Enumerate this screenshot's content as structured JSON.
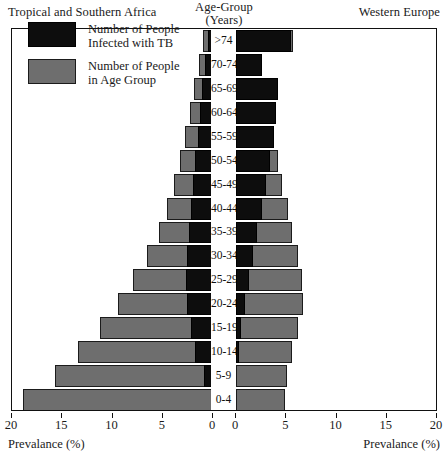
{
  "header": {
    "left_title": "Tropical and Southern Africa",
    "right_title": "Western Europe",
    "center_title_line1": "Age-Group",
    "center_title_line2": "(Years)"
  },
  "legend": {
    "items": [
      {
        "swatch": "black",
        "line1": "Number of People",
        "line2": "Infected with TB"
      },
      {
        "swatch": "gray",
        "line1": "Number of People",
        "line2": "in Age Group"
      }
    ]
  },
  "axes": {
    "left_label": "Prevalance (%)",
    "right_label": "Prevalance (%)",
    "left_ticks": [
      "20",
      "15",
      "10",
      "5",
      "0"
    ],
    "right_ticks": [
      "0",
      "5",
      "10",
      "15",
      "20"
    ]
  },
  "colors": {
    "tb_infected": "#0d0d0d",
    "age_group": "#6e6e6e",
    "frame": "#111111",
    "background": "#ffffff"
  },
  "chart_data": {
    "type": "bar",
    "subtype": "population-pyramid",
    "xlabel": "Prevalance (%)",
    "ylabel": "Age-Group (Years)",
    "xlim": [
      0,
      20
    ],
    "grid": false,
    "legend_position": "upper-left",
    "categories": [
      "0-4",
      "5-9",
      "10-14",
      "15-19",
      "20-24",
      "25-29",
      "30-34",
      "35-39",
      "40-44",
      "45-49",
      "50-54",
      "55-59",
      "60-64",
      "65-69",
      "70-74",
      ">74"
    ],
    "panels": [
      {
        "name": "Tropical and Southern Africa",
        "side": "left",
        "series": [
          {
            "name": "Number of People in Age Group",
            "values": [
              18.9,
              15.7,
              13.4,
              11.2,
              9.5,
              8.0,
              6.6,
              5.4,
              4.6,
              3.9,
              3.3,
              2.8,
              2.3,
              1.9,
              1.4,
              1.0
            ]
          },
          {
            "name": "Number of People Infected with TB",
            "values": [
              0.0,
              0.9,
              1.8,
              2.2,
              2.6,
              2.7,
              2.6,
              2.4,
              2.2,
              2.0,
              1.8,
              1.5,
              1.3,
              1.1,
              0.8,
              0.5
            ]
          }
        ]
      },
      {
        "name": "Western Europe",
        "side": "right",
        "series": [
          {
            "name": "Number of People in Age Group",
            "values": [
              4.9,
              5.1,
              5.6,
              6.2,
              6.7,
              6.6,
              6.2,
              5.6,
              5.2,
              4.6,
              4.2,
              3.8,
              3.5,
              3.1,
              2.6,
              5.7
            ]
          },
          {
            "name": "Number of People Infected with TB",
            "values": [
              0.0,
              0.0,
              0.3,
              0.5,
              0.9,
              1.3,
              1.7,
              2.1,
              2.6,
              3.0,
              3.4,
              3.8,
              4.0,
              4.2,
              2.6,
              5.5
            ]
          }
        ]
      }
    ]
  }
}
